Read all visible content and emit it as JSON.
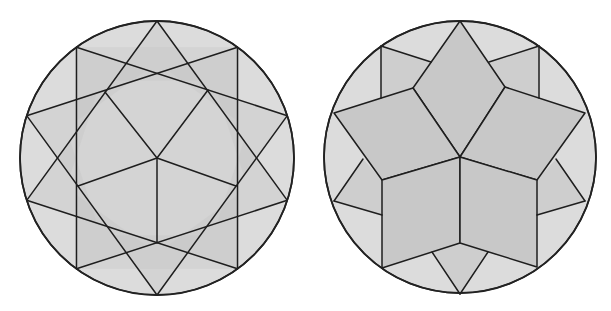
{
  "figures": [
    {
      "name": "decagon-star-construction",
      "center": [
        157,
        158
      ],
      "radius": 137,
      "colors": {
        "light": "#dcdcdc",
        "mid": "#cecece",
        "dark": "#c4c4c4",
        "line": "#1e1e1e"
      },
      "chord_step": 3,
      "points": 10,
      "inner_rays": [
        [
          105,
          92
        ],
        [
          208,
          90
        ],
        [
          78,
          186
        ],
        [
          236,
          186
        ],
        [
          157,
          243
        ]
      ]
    },
    {
      "name": "rhombus-rosette-tiling",
      "center": [
        460,
        157
      ],
      "radius": 136,
      "colors": {
        "light": "#dcdcdc",
        "mid": "#cecece",
        "dark": "#c8c8c8",
        "line": "#1e1e1e"
      },
      "rhombi": [
        [
          [
            460,
            21
          ],
          [
            413,
            88
          ],
          [
            460,
            157
          ],
          [
            505,
            87
          ]
        ],
        [
          [
            413,
            88
          ],
          [
            334,
            113
          ],
          [
            382,
            180
          ],
          [
            460,
            157
          ]
        ],
        [
          [
            505,
            87
          ],
          [
            585,
            113
          ],
          [
            537,
            180
          ],
          [
            460,
            157
          ]
        ],
        [
          [
            460,
            157
          ],
          [
            382,
            180
          ],
          [
            382,
            268
          ],
          [
            460,
            243
          ]
        ],
        [
          [
            460,
            157
          ],
          [
            537,
            180
          ],
          [
            537,
            267
          ],
          [
            460,
            243
          ]
        ]
      ],
      "edge_segments": [
        [
          [
            381,
            46
          ],
          [
            381,
            98
          ]
        ],
        [
          [
            381,
            46
          ],
          [
            431,
            62
          ]
        ],
        [
          [
            539,
            46
          ],
          [
            539,
            98
          ]
        ],
        [
          [
            539,
            46
          ],
          [
            489,
            62
          ]
        ],
        [
          [
            334,
            201
          ],
          [
            363,
            159
          ]
        ],
        [
          [
            334,
            201
          ],
          [
            382,
            215
          ]
        ],
        [
          [
            585,
            201
          ],
          [
            556,
            159
          ]
        ],
        [
          [
            585,
            201
          ],
          [
            537,
            215
          ]
        ],
        [
          [
            460,
            294
          ],
          [
            432,
            252
          ]
        ],
        [
          [
            460,
            294
          ],
          [
            488,
            252
          ]
        ]
      ]
    }
  ]
}
